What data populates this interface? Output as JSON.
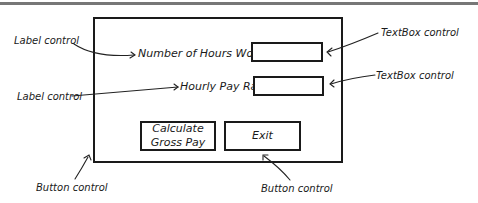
{
  "form": {
    "labels": {
      "hours": "Number of Hours Worked",
      "rate": "Hourly Pay Rate"
    },
    "textboxes": {
      "hours": "",
      "rate": ""
    },
    "buttons": {
      "calculate_line1": "Calculate",
      "calculate_line2": "Gross Pay",
      "exit": "Exit"
    }
  },
  "annotations": {
    "label_control_1": "Label control",
    "label_control_2": "Label control",
    "textbox_control_1": "TextBox control",
    "textbox_control_2": "TextBox control",
    "button_control_1": "Button control",
    "button_control_2": "Button control"
  }
}
